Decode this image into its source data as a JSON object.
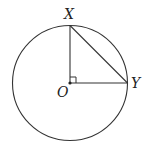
{
  "diagram": {
    "type": "geometry",
    "labels": {
      "top_point": "X",
      "right_point": "Y",
      "center": "O"
    },
    "right_angle_at": "O",
    "colors": {
      "stroke": "#333333",
      "background": "#ffffff"
    }
  }
}
